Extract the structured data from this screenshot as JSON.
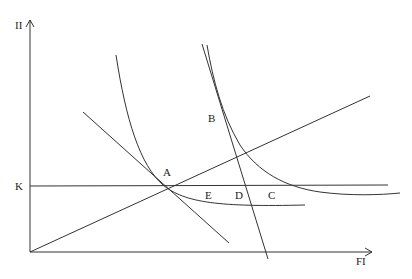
{
  "axes": {
    "y_label": "II",
    "x_label": "FI"
  },
  "lines": {
    "horizontal_label": "K"
  },
  "points": {
    "A": "A",
    "B": "B",
    "C": "C",
    "D": "D",
    "E": "E"
  },
  "colors": {
    "stroke": "#333333",
    "background": "#ffffff"
  }
}
